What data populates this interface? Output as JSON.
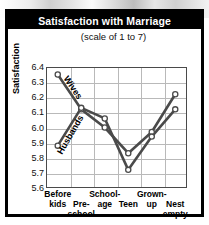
{
  "chart_data": {
    "type": "line",
    "title": "Satisfaction with Marriage",
    "subtitle": "(scale of 1 to 7)",
    "xlabel": "",
    "ylabel": "Satisfaction",
    "categories": [
      "Before kids",
      "Pre-school",
      "School-age",
      "Teen",
      "Grown-up",
      "Nest empty"
    ],
    "category_lines": [
      [
        "Before",
        "kids"
      ],
      [
        "Pre-",
        "school"
      ],
      [
        "School-",
        "age"
      ],
      [
        "Teen"
      ],
      [
        "Grown-",
        "up"
      ],
      [
        "Nest",
        "empty"
      ]
    ],
    "ylim": [
      5.6,
      6.4
    ],
    "yticks": [
      "6.4",
      "6.3",
      "6.2",
      "6.1",
      "6.0",
      "5.9",
      "5.8",
      "5.7",
      "5.6"
    ],
    "ytick_values": [
      6.4,
      6.3,
      6.2,
      6.1,
      6.0,
      5.9,
      5.8,
      5.7,
      5.6
    ],
    "grid": true,
    "legend": "inline-labels",
    "series": [
      {
        "name": "Wives",
        "values": [
          6.35,
          6.12,
          6.0,
          5.83,
          5.97,
          6.22
        ]
      },
      {
        "name": "Husbands",
        "values": [
          5.88,
          6.13,
          6.06,
          5.72,
          5.94,
          6.12
        ]
      }
    ]
  },
  "colors": {
    "titlebar_bg": "#000000",
    "titlebar_text": "#ffffff",
    "line": "#4a4a4a",
    "grid": "#b9b9b9",
    "marker_fill": "#ffffff",
    "border": "#000000"
  }
}
